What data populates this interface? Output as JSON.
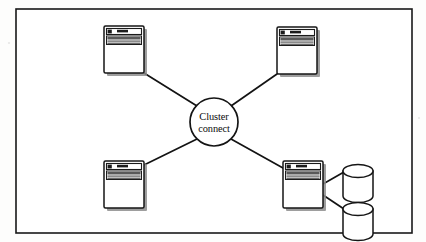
{
  "diagram": {
    "type": "network-topology",
    "background_color": "#fdfdfc",
    "line_color": "#141414",
    "frame": {
      "name": "outer-border",
      "x": 16,
      "y": 9,
      "width": 396,
      "height": 224
    },
    "hub": {
      "label_line_1": "Cluster",
      "label_line_2": "connect",
      "cx": 214,
      "cy": 122,
      "r": 24
    },
    "nodes": [
      {
        "id": "node-top-left",
        "name": "server-node-top-left",
        "x": 104,
        "y": 26,
        "width": 40,
        "height": 47
      },
      {
        "id": "node-top-right",
        "name": "server-node-top-right",
        "x": 277,
        "y": 27,
        "width": 40,
        "height": 47
      },
      {
        "id": "node-bottom-left",
        "name": "server-node-bottom-left",
        "x": 104,
        "y": 161,
        "width": 40,
        "height": 47
      },
      {
        "id": "node-bottom-right",
        "name": "server-node-bottom-right",
        "x": 283,
        "y": 161,
        "width": 40,
        "height": 47
      }
    ],
    "databases": [
      {
        "id": "db-upper",
        "name": "database-cylinder-upper",
        "cx": 358,
        "cy": 171,
        "rx": 15,
        "height": 25
      },
      {
        "id": "db-lower",
        "name": "database-cylinder-lower",
        "cx": 358,
        "cy": 209,
        "rx": 15,
        "height": 25
      }
    ],
    "links": [
      {
        "id": "link-hub-top-left",
        "name": "link-hub-to-top-left",
        "x1": 144,
        "y1": 73,
        "x2": 197,
        "y2": 106
      },
      {
        "id": "link-hub-top-right",
        "name": "link-hub-to-top-right",
        "x1": 231,
        "y1": 106,
        "x2": 277,
        "y2": 74
      },
      {
        "id": "link-hub-bottom-left",
        "name": "link-hub-to-bottom-left",
        "x1": 144,
        "y1": 165,
        "x2": 197,
        "y2": 139
      },
      {
        "id": "link-hub-bottom-right",
        "name": "link-hub-to-bottom-right",
        "x1": 231,
        "y1": 139,
        "x2": 283,
        "y2": 168
      },
      {
        "id": "link-db-upper",
        "name": "link-server-to-database-upper",
        "x1": 323,
        "y1": 184,
        "x2": 343,
        "y2": 171
      },
      {
        "id": "link-db-lower",
        "name": "link-server-to-database-lower",
        "x1": 323,
        "y1": 195,
        "x2": 343,
        "y2": 209
      }
    ]
  }
}
